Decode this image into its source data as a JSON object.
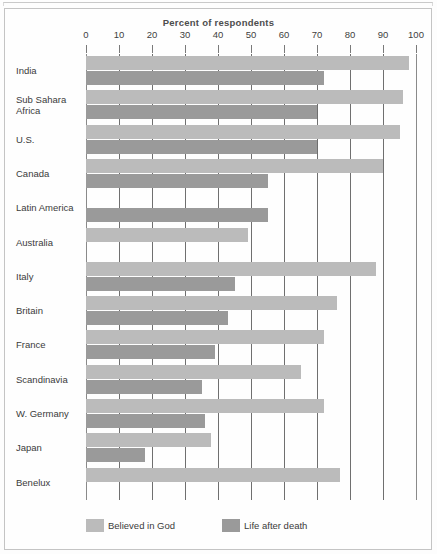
{
  "chart_data": {
    "type": "bar",
    "orientation": "horizontal",
    "title": "Percent of respondents",
    "xlabel": "Percent of respondents",
    "ylabel": "",
    "xlim": [
      0,
      100
    ],
    "xticks": [
      0,
      10,
      20,
      30,
      40,
      50,
      60,
      70,
      80,
      90,
      100
    ],
    "grid": true,
    "grid_axis": "x",
    "legend_position": "bottom",
    "categories": [
      "India",
      "Sub Sahara Africa",
      "U.S.",
      "Canada",
      "Latin America",
      "Australia",
      "Italy",
      "Britain",
      "France",
      "Scandinavia",
      "W. Germany",
      "Japan",
      "Benelux"
    ],
    "category_labels": [
      "India",
      "Sub Sahara\nAfrica",
      "U.S.",
      "Canada",
      "Latin America",
      "Australia",
      "Italy",
      "Britain",
      "France",
      "Scandinavia",
      "W. Germany",
      "Japan",
      "Benelux"
    ],
    "series": [
      {
        "name": "Believed in God",
        "color": "#bbbbbb",
        "values": [
          98,
          96,
          95,
          90,
          null,
          49,
          88,
          76,
          72,
          65,
          72,
          38,
          77
        ]
      },
      {
        "name": "Life after death",
        "color": "#9a9a9a",
        "values": [
          72,
          70,
          70,
          55,
          55,
          null,
          45,
          43,
          39,
          35,
          36,
          18,
          null
        ]
      }
    ]
  },
  "legend": {
    "items": [
      {
        "label": "Believed in God",
        "color": "#bbbbbb"
      },
      {
        "label": "Life after death",
        "color": "#9a9a9a"
      }
    ]
  },
  "axis": {
    "tick_labels": [
      "0",
      "10",
      "20",
      "30",
      "40",
      "50",
      "60",
      "70",
      "80",
      "90",
      "100"
    ]
  }
}
